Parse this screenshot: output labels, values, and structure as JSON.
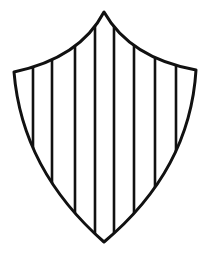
{
  "figure": {
    "pattern": "vertical-stripes",
    "stroke_color": "#111111",
    "fill_color": "#ffffff",
    "stripe_count": 8
  }
}
